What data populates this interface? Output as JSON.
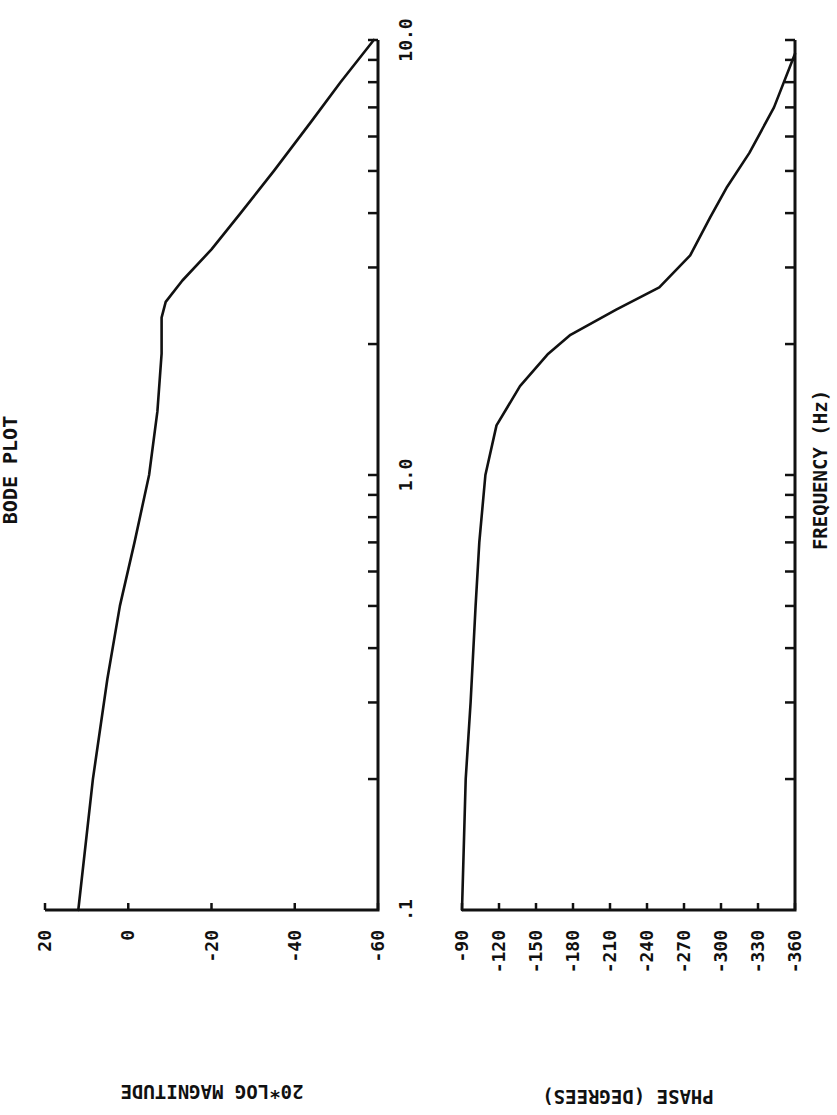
{
  "chart_data": [
    {
      "type": "line",
      "title": "BODE PLOT",
      "panel": "magnitude",
      "xlabel": "FREQUENCY (Hz)",
      "ylabel": "20*LOG MAGNITUDE",
      "xscale": "log",
      "xlim": [
        0.1,
        10.0
      ],
      "ylim": [
        -60,
        20
      ],
      "x_tick_labels": [
        ".1",
        "1.0",
        "10.0"
      ],
      "y_tick_labels": [
        "20",
        "0",
        "-20",
        "-40",
        "-60"
      ],
      "y_ticks": [
        20,
        0,
        -20,
        -40,
        -60
      ],
      "grid": false,
      "series": [
        {
          "name": "magnitude",
          "x": [
            0.1,
            0.2,
            0.34,
            0.5,
            0.7,
            1.0,
            1.4,
            1.9,
            2.3,
            2.5,
            2.8,
            3.3,
            4.0,
            5.0,
            6.5,
            8.0,
            10.0
          ],
          "values": [
            12,
            8.5,
            5,
            2,
            -1.5,
            -5,
            -7,
            -8,
            -8,
            -9,
            -13,
            -20,
            -27,
            -35,
            -44,
            -51,
            -59
          ]
        }
      ]
    },
    {
      "type": "line",
      "title": "BODE PLOT",
      "panel": "phase",
      "xlabel": "FREQUENCY (Hz)",
      "ylabel": "PHASE (DEGREES)",
      "xscale": "log",
      "xlim": [
        0.1,
        10.0
      ],
      "ylim": [
        -360,
        -90
      ],
      "x_tick_labels": [
        ".1",
        "1.0",
        "10.0"
      ],
      "y_tick_labels": [
        "-90",
        "-120",
        "-150",
        "-180",
        "-210",
        "-240",
        "-270",
        "-300",
        "-330",
        "-360"
      ],
      "y_ticks": [
        -90,
        -120,
        -150,
        -180,
        -210,
        -240,
        -270,
        -300,
        -330,
        -360
      ],
      "grid": false,
      "series": [
        {
          "name": "phase",
          "x": [
            0.1,
            0.2,
            0.3,
            0.5,
            0.7,
            1.0,
            1.3,
            1.6,
            1.9,
            2.1,
            2.4,
            2.7,
            3.2,
            3.9,
            4.6,
            5.5,
            7.0,
            9.3
          ],
          "values": [
            -90,
            -93,
            -97,
            -101,
            -104,
            -109,
            -118,
            -137,
            -160,
            -178,
            -215,
            -250,
            -275,
            -291,
            -305,
            -323,
            -343,
            -360
          ]
        }
      ]
    }
  ],
  "labels": {
    "title": "BODE PLOT",
    "x_axis": "FREQUENCY   (Hz)",
    "mag_axis": "20*LOG MAGNITUDE",
    "phase_axis": "PHASE  (DEGREES)",
    "freq_ticks": [
      ".1",
      "1.0",
      "10.0"
    ],
    "mag_ticks": [
      "20",
      "0",
      "-20",
      "-40",
      "-60"
    ],
    "phase_ticks": [
      "-90",
      "-120",
      "-150",
      "-180",
      "-210",
      "-240",
      "-270",
      "-300",
      "-330",
      "-360"
    ]
  }
}
